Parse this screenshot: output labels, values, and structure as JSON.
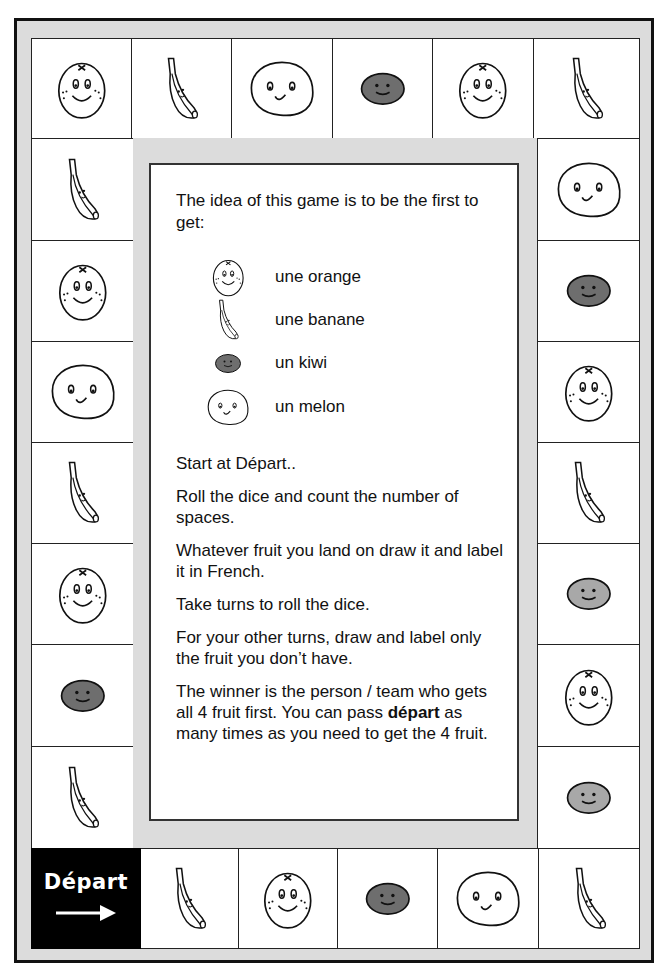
{
  "board": {
    "title": "French fruit board game",
    "colors": {
      "frame": "#dcdcdc",
      "border": "#111111",
      "kiwi_dark": "#6e6e6e",
      "kiwi_light": "#a8a8a8",
      "depart_bg": "#000000"
    },
    "start_cell": {
      "label": "Départ",
      "icon": "arrow-right-icon"
    },
    "top_row": [
      "orange",
      "banana",
      "melon",
      "kiwi",
      "orange",
      "banana"
    ],
    "right_column": [
      "melon",
      "kiwi",
      "orange",
      "banana",
      "kiwi-light",
      "orange",
      "kiwi-light"
    ],
    "bottom_row": [
      "banana",
      "orange",
      "kiwi",
      "melon",
      "banana"
    ],
    "left_column": [
      "banana",
      "orange",
      "melon",
      "banana",
      "orange",
      "kiwi",
      "banana"
    ]
  },
  "instructions": {
    "intro": "The idea of this game is to be the first to get:",
    "legend": [
      {
        "icon": "orange",
        "label": "une orange"
      },
      {
        "icon": "banana",
        "label": "une banane"
      },
      {
        "icon": "kiwi",
        "label": "un kiwi"
      },
      {
        "icon": "melon",
        "label": "un melon"
      }
    ],
    "rules": [
      "Start at Départ..",
      "Roll the dice and count the number of spaces.",
      "Whatever fruit you land on draw it and label it in French.",
      "Take turns to roll the dice.",
      "For your other turns, draw and label only the fruit you don’t have."
    ],
    "final_rule": {
      "part1": "The winner is the person / team who gets all 4 fruit first.  You can pass ",
      "bold": "départ",
      "part2": " as many times as you need to get the 4 fruit."
    }
  }
}
